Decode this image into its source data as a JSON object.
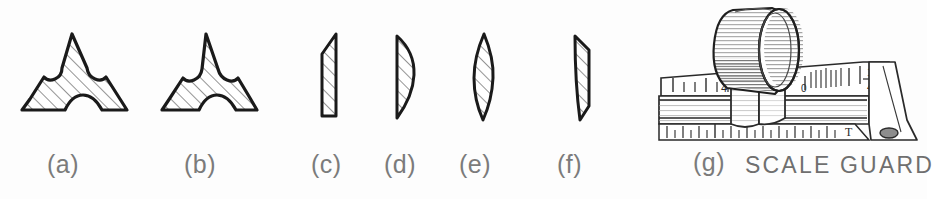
{
  "figure": {
    "background_color": "#fdfdfd",
    "ink_color": "#1a1a1a",
    "label_color": "#7b7b7b",
    "hatch_color": "#3b3b3b",
    "items": [
      {
        "key": "a",
        "label": "(a)",
        "icon": "trefoil-section-wide-icon",
        "description": "hatched trefoil scale-guard cross section, wide arms"
      },
      {
        "key": "b",
        "label": "(b)",
        "icon": "trefoil-section-narrow-icon",
        "description": "hatched trefoil scale-guard cross section, narrow arms"
      },
      {
        "key": "c",
        "label": "(c)",
        "icon": "blade-section-straight-icon",
        "description": "hatched straight blade section with beveled top right corner"
      },
      {
        "key": "d",
        "label": "(d)",
        "icon": "blade-section-convex-icon",
        "description": "hatched blade section, flat back and convex edge"
      },
      {
        "key": "e",
        "label": "(e)",
        "icon": "blade-section-lens-icon",
        "description": "hatched lens shaped blade section pointed both ends"
      },
      {
        "key": "f",
        "label": "(f)",
        "icon": "blade-section-skew-icon",
        "description": "hatched skewed sliver blade section"
      },
      {
        "key": "g",
        "label": "(g)",
        "icon": "scale-guard-pictorial-icon",
        "description": "pictorial drawing of scale guard clipped on a ruler"
      }
    ]
  },
  "caption": {
    "scale_guard": "SCALE GUARD"
  },
  "scale_markings": {
    "left_number": "4",
    "mid_number": "92",
    "zero_number": "0",
    "fraction_numerator": "1",
    "fraction_denominator": "4",
    "right_letter": "T"
  }
}
